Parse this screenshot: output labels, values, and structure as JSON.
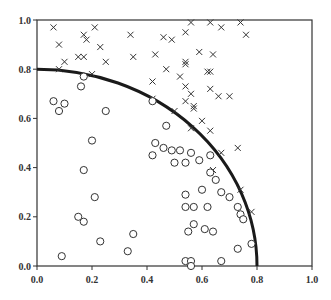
{
  "chart_data": {
    "type": "scatter",
    "title": "",
    "xlabel": "",
    "ylabel": "",
    "xlim": [
      0.0,
      1.0
    ],
    "ylim": [
      0.0,
      1.0
    ],
    "grid": false,
    "legend": null,
    "x_ticks": [
      "0.0",
      "0.2",
      "0.4",
      "0.6",
      "0.8",
      "1.0"
    ],
    "y_ticks": [
      "0.0",
      "0.2",
      "0.4",
      "0.6",
      "0.8",
      "1.0"
    ],
    "annotations": [
      {
        "type": "quarter-circle-arc",
        "center": [
          0,
          0
        ],
        "radius": 0.8
      }
    ],
    "series": [
      {
        "name": "outside (x marker)",
        "marker": "x",
        "points": [
          [
            0.06,
            0.97
          ],
          [
            0.21,
            0.97
          ],
          [
            0.17,
            0.94
          ],
          [
            0.34,
            0.94
          ],
          [
            0.08,
            0.9
          ],
          [
            0.18,
            0.92
          ],
          [
            0.23,
            0.89
          ],
          [
            0.46,
            0.93
          ],
          [
            0.49,
            0.92
          ],
          [
            0.54,
            0.95
          ],
          [
            0.56,
            0.99
          ],
          [
            0.63,
            0.99
          ],
          [
            0.67,
            0.97
          ],
          [
            0.74,
            0.99
          ],
          [
            0.76,
            0.94
          ],
          [
            0.1,
            0.83
          ],
          [
            0.15,
            0.85
          ],
          [
            0.17,
            0.85
          ],
          [
            0.25,
            0.83
          ],
          [
            0.35,
            0.85
          ],
          [
            0.43,
            0.86
          ],
          [
            0.59,
            0.87
          ],
          [
            0.64,
            0.86
          ],
          [
            0.54,
            0.83
          ],
          [
            0.54,
            0.82
          ],
          [
            0.08,
            0.8
          ],
          [
            0.2,
            0.78
          ],
          [
            0.47,
            0.8
          ],
          [
            0.52,
            0.77
          ],
          [
            0.62,
            0.79
          ],
          [
            0.63,
            0.79
          ],
          [
            0.42,
            0.75
          ],
          [
            0.54,
            0.73
          ],
          [
            0.56,
            0.7
          ],
          [
            0.63,
            0.72
          ],
          [
            0.66,
            0.69
          ],
          [
            0.7,
            0.69
          ],
          [
            0.54,
            0.67
          ],
          [
            0.57,
            0.65
          ],
          [
            0.57,
            0.64
          ],
          [
            0.42,
            0.68
          ],
          [
            0.5,
            0.63
          ],
          [
            0.6,
            0.59
          ],
          [
            0.56,
            0.56
          ],
          [
            0.63,
            0.55
          ],
          [
            0.73,
            0.48
          ],
          [
            0.67,
            0.46
          ],
          [
            0.64,
            0.39
          ],
          [
            0.74,
            0.31
          ],
          [
            0.78,
            0.22
          ]
        ]
      },
      {
        "name": "inside (o marker)",
        "marker": "o",
        "points": [
          [
            0.06,
            0.67
          ],
          [
            0.08,
            0.63
          ],
          [
            0.1,
            0.66
          ],
          [
            0.17,
            0.77
          ],
          [
            0.16,
            0.73
          ],
          [
            0.25,
            0.63
          ],
          [
            0.2,
            0.51
          ],
          [
            0.17,
            0.39
          ],
          [
            0.21,
            0.28
          ],
          [
            0.15,
            0.2
          ],
          [
            0.17,
            0.18
          ],
          [
            0.23,
            0.1
          ],
          [
            0.09,
            0.04
          ],
          [
            0.33,
            0.06
          ],
          [
            0.35,
            0.13
          ],
          [
            0.42,
            0.67
          ],
          [
            0.47,
            0.57
          ],
          [
            0.43,
            0.5
          ],
          [
            0.42,
            0.45
          ],
          [
            0.46,
            0.48
          ],
          [
            0.49,
            0.47
          ],
          [
            0.52,
            0.47
          ],
          [
            0.5,
            0.42
          ],
          [
            0.54,
            0.42
          ],
          [
            0.56,
            0.46
          ],
          [
            0.59,
            0.43
          ],
          [
            0.63,
            0.45
          ],
          [
            0.63,
            0.38
          ],
          [
            0.65,
            0.35
          ],
          [
            0.6,
            0.31
          ],
          [
            0.67,
            0.3
          ],
          [
            0.7,
            0.28
          ],
          [
            0.54,
            0.29
          ],
          [
            0.54,
            0.24
          ],
          [
            0.57,
            0.24
          ],
          [
            0.62,
            0.24
          ],
          [
            0.73,
            0.24
          ],
          [
            0.74,
            0.21
          ],
          [
            0.75,
            0.19
          ],
          [
            0.57,
            0.17
          ],
          [
            0.61,
            0.15
          ],
          [
            0.64,
            0.14
          ],
          [
            0.55,
            0.14
          ],
          [
            0.78,
            0.09
          ],
          [
            0.73,
            0.07
          ],
          [
            0.67,
            0.02
          ],
          [
            0.54,
            0.02
          ],
          [
            0.56,
            0.02
          ],
          [
            0.56,
            0.0
          ]
        ]
      }
    ]
  },
  "colors": {
    "axis": "#333333",
    "marker": "#333333",
    "arc": "#1a1a1a",
    "background": "#ffffff"
  },
  "layout": {
    "plot_left": 37,
    "plot_right": 312,
    "plot_top": 20,
    "plot_bottom": 266
  }
}
